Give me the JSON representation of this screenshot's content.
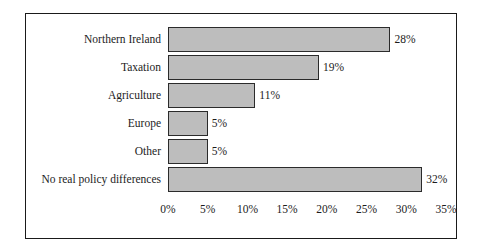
{
  "chart_data": {
    "type": "bar",
    "orientation": "horizontal",
    "title": "",
    "subtitle": "",
    "xlabel": "",
    "ylabel": "",
    "categories": [
      "Northern Ireland",
      "Taxation",
      "Agriculture",
      "Europe",
      "Other",
      "No real policy differences"
    ],
    "values": [
      28,
      19,
      11,
      5,
      5,
      32
    ],
    "value_labels": [
      "28%",
      "19%",
      "11%",
      "5%",
      "5%",
      "32%"
    ],
    "xlim": [
      0,
      35
    ],
    "xticks": [
      0,
      5,
      10,
      15,
      20,
      25,
      30,
      35
    ],
    "xtick_labels": [
      "0%",
      "5%",
      "10%",
      "15%",
      "20%",
      "25%",
      "30%",
      "35%"
    ],
    "grid": false,
    "legend": null,
    "legend_position": "none",
    "colors": {
      "bar_fill": "#bdbdbd",
      "bar_border": "#2b2b2b",
      "frame_border": "#1a1a1a",
      "text": "#1c1c1c",
      "background": "#ffffff"
    }
  }
}
